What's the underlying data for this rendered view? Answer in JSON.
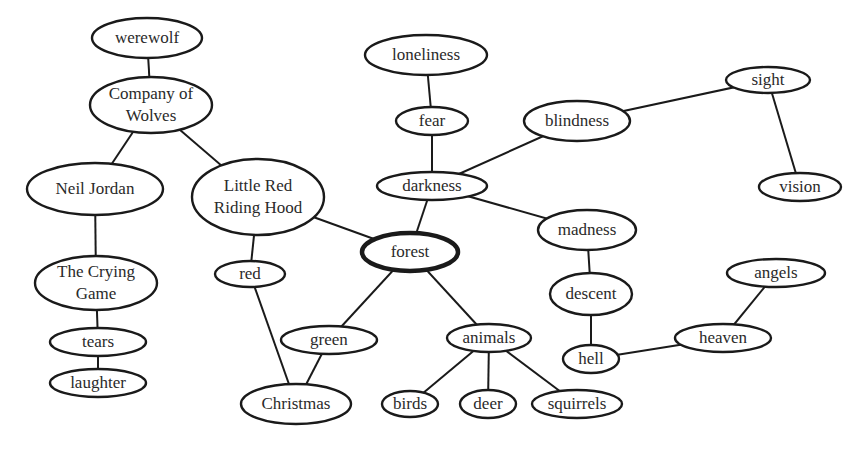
{
  "diagram": {
    "type": "concept-map",
    "central_node": "forest",
    "colors": {
      "stroke": "#1a1a1a",
      "text": "#2a2a2a",
      "background": "#ffffff"
    },
    "nodes": [
      {
        "id": "werewolf",
        "lines": [
          "werewolf"
        ],
        "cx": 147,
        "cy": 38,
        "rx": 55,
        "ry": 20
      },
      {
        "id": "company",
        "lines": [
          "Company of",
          "Wolves"
        ],
        "cx": 151,
        "cy": 105,
        "rx": 61,
        "ry": 28
      },
      {
        "id": "neil",
        "lines": [
          "Neil Jordan"
        ],
        "cx": 95,
        "cy": 189,
        "rx": 68,
        "ry": 26
      },
      {
        "id": "lrrh",
        "lines": [
          "Little Red",
          "Riding Hood"
        ],
        "cx": 258,
        "cy": 197,
        "rx": 66,
        "ry": 38
      },
      {
        "id": "crying",
        "lines": [
          "The Crying",
          "Game"
        ],
        "cx": 96,
        "cy": 283,
        "rx": 61,
        "ry": 27
      },
      {
        "id": "tears",
        "lines": [
          "tears"
        ],
        "cx": 98,
        "cy": 342,
        "rx": 48,
        "ry": 14
      },
      {
        "id": "laughter",
        "lines": [
          "laughter"
        ],
        "cx": 98,
        "cy": 383,
        "rx": 48,
        "ry": 14
      },
      {
        "id": "red",
        "lines": [
          "red"
        ],
        "cx": 250,
        "cy": 274,
        "rx": 35,
        "ry": 13
      },
      {
        "id": "green",
        "lines": [
          "green"
        ],
        "cx": 329,
        "cy": 340,
        "rx": 48,
        "ry": 14
      },
      {
        "id": "christmas",
        "lines": [
          "Christmas"
        ],
        "cx": 296,
        "cy": 404,
        "rx": 55,
        "ry": 20
      },
      {
        "id": "loneliness",
        "lines": [
          "loneliness"
        ],
        "cx": 426,
        "cy": 55,
        "rx": 61,
        "ry": 20
      },
      {
        "id": "fear",
        "lines": [
          "fear"
        ],
        "cx": 432,
        "cy": 121,
        "rx": 36,
        "ry": 14
      },
      {
        "id": "darkness",
        "lines": [
          "darkness"
        ],
        "cx": 432,
        "cy": 186,
        "rx": 55,
        "ry": 14
      },
      {
        "id": "forest",
        "lines": [
          "forest"
        ],
        "cx": 410,
        "cy": 252,
        "rx": 48,
        "ry": 19,
        "hub": true
      },
      {
        "id": "blindness",
        "lines": [
          "blindness"
        ],
        "cx": 577,
        "cy": 121,
        "rx": 53,
        "ry": 20
      },
      {
        "id": "madness",
        "lines": [
          "madness"
        ],
        "cx": 587,
        "cy": 230,
        "rx": 49,
        "ry": 20
      },
      {
        "id": "descent",
        "lines": [
          "descent"
        ],
        "cx": 591,
        "cy": 294,
        "rx": 41,
        "ry": 21
      },
      {
        "id": "hell",
        "lines": [
          "hell"
        ],
        "cx": 591,
        "cy": 359,
        "rx": 28,
        "ry": 14
      },
      {
        "id": "animals",
        "lines": [
          "animals"
        ],
        "cx": 489,
        "cy": 338,
        "rx": 42,
        "ry": 14
      },
      {
        "id": "birds",
        "lines": [
          "birds"
        ],
        "cx": 410,
        "cy": 404,
        "rx": 28,
        "ry": 13
      },
      {
        "id": "deer",
        "lines": [
          "deer"
        ],
        "cx": 488,
        "cy": 404,
        "rx": 28,
        "ry": 14
      },
      {
        "id": "squirrels",
        "lines": [
          "squirrels"
        ],
        "cx": 577,
        "cy": 404,
        "rx": 45,
        "ry": 14
      },
      {
        "id": "sight",
        "lines": [
          "sight"
        ],
        "cx": 768,
        "cy": 80,
        "rx": 42,
        "ry": 13
      },
      {
        "id": "vision",
        "lines": [
          "vision"
        ],
        "cx": 800,
        "cy": 187,
        "rx": 41,
        "ry": 14
      },
      {
        "id": "angels",
        "lines": [
          "angels"
        ],
        "cx": 776,
        "cy": 273,
        "rx": 49,
        "ry": 14
      },
      {
        "id": "heaven",
        "lines": [
          "heaven"
        ],
        "cx": 723,
        "cy": 338,
        "rx": 48,
        "ry": 14
      }
    ],
    "edges": [
      [
        "werewolf",
        "company"
      ],
      [
        "company",
        "neil"
      ],
      [
        "company",
        "lrrh"
      ],
      [
        "neil",
        "crying"
      ],
      [
        "crying",
        "tears"
      ],
      [
        "tears",
        "laughter"
      ],
      [
        "lrrh",
        "red"
      ],
      [
        "lrrh",
        "forest"
      ],
      [
        "red",
        "christmas"
      ],
      [
        "green",
        "christmas"
      ],
      [
        "forest",
        "green"
      ],
      [
        "forest",
        "darkness"
      ],
      [
        "forest",
        "animals"
      ],
      [
        "loneliness",
        "fear"
      ],
      [
        "fear",
        "darkness"
      ],
      [
        "darkness",
        "blindness"
      ],
      [
        "darkness",
        "madness"
      ],
      [
        "blindness",
        "sight"
      ],
      [
        "sight",
        "vision"
      ],
      [
        "madness",
        "descent"
      ],
      [
        "descent",
        "hell"
      ],
      [
        "hell",
        "heaven"
      ],
      [
        "heaven",
        "angels"
      ],
      [
        "animals",
        "birds"
      ],
      [
        "animals",
        "deer"
      ],
      [
        "animals",
        "squirrels"
      ]
    ]
  }
}
